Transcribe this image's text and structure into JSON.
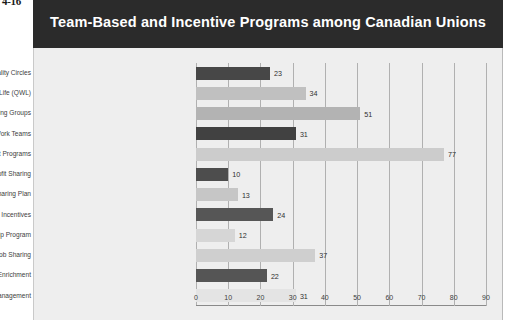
{
  "figure_number": "4-16",
  "title": "Team-Based and Incentive Programs among Canadian Unions",
  "colors": {
    "title_bar_bg": "#2b2b2b",
    "title_text": "#ffffff",
    "panel_bg": "#eeeeee",
    "bar_dark": "#4a4a4a",
    "bar_light": "#c4c4c4",
    "bar_pale": "#dcdcdc",
    "gridline": "#b0b0b0",
    "label_text": "#3d3d3d"
  },
  "chart_data": {
    "type": "bar",
    "orientation": "horizontal",
    "title": "Team-Based and Incentive Programs among Canadian Unions",
    "xlabel": "% of Union Bargaining Units with Progam",
    "ylabel": "",
    "xlim": [
      0,
      90
    ],
    "xticks": [
      0,
      10,
      20,
      30,
      40,
      50,
      60,
      70,
      80,
      90
    ],
    "grid": "vertical",
    "legend": "none",
    "categories": [
      "Quality Circles",
      "Quality of Work Life (QWL)",
      "Problem-Solving Groups",
      "Work Teams",
      "Employee/Management Joint Programs",
      "Profit Sharing",
      "Productivity Sharing Plan",
      "Group/Team Incentives",
      "Employee Stock Ownership Program",
      "Job Sharing",
      "Job Enlargement/Enrichment",
      "Total Quality Management"
    ],
    "values": [
      23,
      34,
      51,
      31,
      77,
      10,
      13,
      24,
      12,
      37,
      22,
      31
    ],
    "bar_colors": [
      "#474747",
      "#c0c0c0",
      "#b3b3b3",
      "#414141",
      "#cccccc",
      "#4d4d4d",
      "#c6c6c6",
      "#565656",
      "#d6d6d6",
      "#cfcfcf",
      "#555555",
      "#e4e4e4"
    ]
  }
}
